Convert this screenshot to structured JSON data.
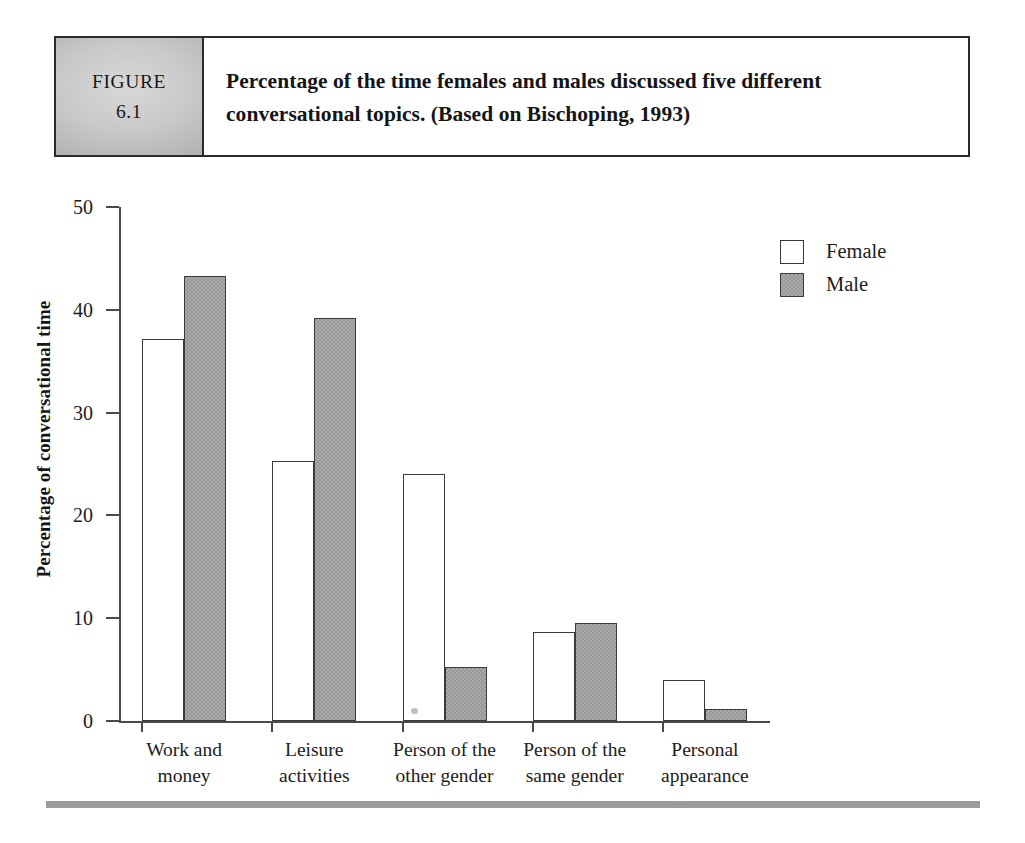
{
  "figure": {
    "badge_word": "FIGURE",
    "badge_number": "6.1",
    "caption": "Percentage of the time females and males discussed five different conversational topics. (Based on Bischoping, 1993)"
  },
  "chart_data": {
    "type": "bar",
    "title": "",
    "xlabel": "",
    "ylabel": "Percentage of conversational time",
    "ylim": [
      0,
      50
    ],
    "yticks": [
      0,
      10,
      20,
      30,
      40,
      50
    ],
    "ytick_labels": [
      "0",
      "10",
      "20",
      "30",
      "40",
      "50"
    ],
    "grid": false,
    "legend_position": "top-right",
    "categories": [
      "Work and money",
      "Leisure activities",
      "Person of the other gender",
      "Person of the same gender",
      "Personal appearance"
    ],
    "category_lines": [
      [
        "Work and",
        "money"
      ],
      [
        "Leisure",
        "activities"
      ],
      [
        "Person of the",
        "other gender"
      ],
      [
        "Person of the",
        "same gender"
      ],
      [
        "Personal",
        "appearance"
      ]
    ],
    "series": [
      {
        "name": "Female",
        "color": "#ffffff",
        "values": [
          37.2,
          25.3,
          24.0,
          8.7,
          4.0
        ]
      },
      {
        "name": "Male",
        "color": "#989898",
        "values": [
          43.3,
          39.2,
          5.3,
          9.5,
          1.2
        ]
      }
    ]
  },
  "legend": {
    "items": [
      {
        "label": "Female",
        "swatch": "hollow-square"
      },
      {
        "label": "Male",
        "swatch": "gray-square"
      }
    ]
  }
}
